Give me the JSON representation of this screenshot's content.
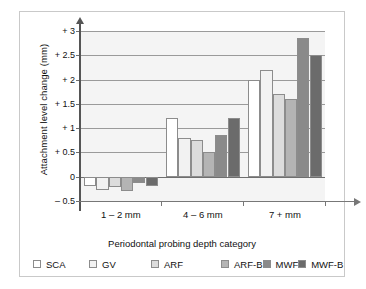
{
  "chart_data": {
    "type": "bar",
    "title": "",
    "xlabel": "Periodontal probing depth category",
    "ylabel": "Attachment level change (mm)",
    "categories": [
      "1 – 2 mm",
      "4 – 6 mm",
      "7 + mm"
    ],
    "ylim": [
      -0.5,
      3
    ],
    "yticks": [
      "+ 3",
      "+ 2.5",
      "+ 2",
      "+ 1.5",
      "+ 1",
      "+ 0.5",
      "0",
      "– 0.5"
    ],
    "ytick_values": [
      3,
      2.5,
      2,
      1.5,
      1,
      0.5,
      0,
      -0.5
    ],
    "grid": true,
    "legend_position": "bottom-left",
    "series": [
      {
        "name": "SCA",
        "color": "#ffffff",
        "values": [
          -0.2,
          1.2,
          2.0
        ]
      },
      {
        "name": "GV",
        "color": "#f2f2f2",
        "values": [
          -0.27,
          0.8,
          2.2
        ]
      },
      {
        "name": "ARF",
        "color": "#dcdcdc",
        "values": [
          -0.22,
          0.75,
          1.7
        ]
      },
      {
        "name": "ARF-B",
        "color": "#b4b4b4",
        "values": [
          -0.3,
          0.5,
          1.6
        ]
      },
      {
        "name": "MWF",
        "color": "#8a8a8a",
        "values": [
          -0.12,
          0.85,
          2.85
        ]
      },
      {
        "name": "MWF-B",
        "color": "#6b6b6b",
        "values": [
          -0.2,
          1.2,
          2.5
        ]
      }
    ]
  },
  "legend": {
    "items": [
      {
        "label": "SCA",
        "color": "#ffffff"
      },
      {
        "label": "GV",
        "color": "#f2f2f2"
      },
      {
        "label": "ARF",
        "color": "#dcdcdc"
      },
      {
        "label": "ARF-B",
        "color": "#b4b4b4"
      },
      {
        "label": "MWF",
        "color": "#8a8a8a"
      },
      {
        "label": "MWF-B",
        "color": "#6b6b6b"
      }
    ]
  }
}
